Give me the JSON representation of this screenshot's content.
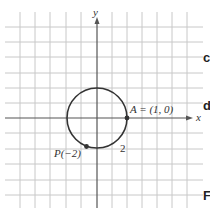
{
  "figure": {
    "axes": {
      "x_label": "x",
      "y_label": "y"
    },
    "circle": {
      "description": "unit circle centered at origin",
      "radius_units": 1
    },
    "points": {
      "A": {
        "label": "A = (1, 0)"
      },
      "P": {
        "label": "P(−2)"
      }
    },
    "arc_length_label": "2",
    "edge_letters": [
      "c",
      "d",
      "F"
    ],
    "colors": {
      "grid": "#c8c8c8",
      "axis": "#555555",
      "curve": "#333333"
    }
  }
}
